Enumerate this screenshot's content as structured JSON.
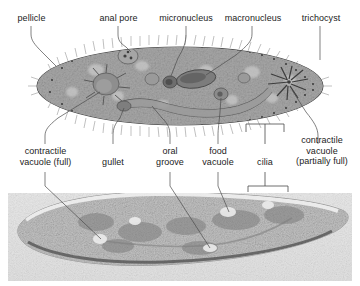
{
  "figure": {
    "panels": [
      {
        "name": "labeled-illustration",
        "kind": "diagram",
        "caption": ""
      },
      {
        "name": "light-micrograph",
        "kind": "photograph",
        "caption": ""
      }
    ],
    "colors": {
      "cell_body_light": "#b9b9b9",
      "cell_body_mid": "#949494",
      "cell_body_dark": "#6f6f6f",
      "outline": "#3b3b3b",
      "photo_background": "#e9e9e9",
      "photo_cell": "#cfcfcf",
      "leader_line": "#4a4a4a",
      "text": "#1b1b1b",
      "page_background": "#ffffff"
    }
  },
  "labels_top": [
    {
      "id": "pellicle",
      "text": "pellicle"
    },
    {
      "id": "anal-pore",
      "text": "anal pore"
    },
    {
      "id": "micronucleus",
      "text": "micronucleus"
    },
    {
      "id": "macronucleus",
      "text": "macronucleus"
    },
    {
      "id": "trichocyst",
      "text": "trichocyst"
    }
  ],
  "labels_bottom": [
    {
      "id": "contractile-vacuole-full",
      "line1": "contractile",
      "line2": "vacuole (full)",
      "line3": ""
    },
    {
      "id": "gullet",
      "line1": "gullet",
      "line2": "",
      "line3": ""
    },
    {
      "id": "oral-groove",
      "line1": "oral",
      "line2": "groove",
      "line3": ""
    },
    {
      "id": "food-vacuole",
      "line1": "food",
      "line2": "vacuole",
      "line3": ""
    },
    {
      "id": "cilia",
      "line1": "cilia",
      "line2": "",
      "line3": ""
    },
    {
      "id": "contractile-vacuole-partially-full",
      "line1": "contractile",
      "line2": "vacuole",
      "line3": "(partially full)"
    }
  ]
}
